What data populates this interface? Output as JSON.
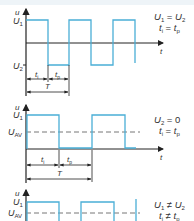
{
  "header": {
    "cut_text": ""
  },
  "colors": {
    "signal": "#4aaed6",
    "axis": "#222222",
    "dashed": "#666666",
    "text": "#333333"
  },
  "graphs": [
    {
      "id": "graph1",
      "y_axis_label": "u",
      "level_labels": {
        "high": "U",
        "high_sub": "1",
        "low": "U",
        "low_sub": "2"
      },
      "x_axis_label": "t",
      "condition_line1": {
        "a": "U",
        "a_sub": "1",
        "op": " = ",
        "b": "U",
        "b_sub": "2"
      },
      "condition_line2": {
        "a": "t",
        "a_sub": "i",
        "op": " = ",
        "b": "t",
        "b_sub": "p"
      },
      "dim_ti": {
        "t": "t",
        "sub": "i"
      },
      "dim_tp": {
        "t": "t",
        "sub": "p"
      },
      "dim_T": "T"
    },
    {
      "id": "graph2",
      "y_axis_label": "u",
      "level_labels": {
        "high": "U",
        "high_sub": "1",
        "avg": "U",
        "avg_sub": "AV"
      },
      "x_axis_label": "t",
      "condition_line1": {
        "a": "U",
        "a_sub": "2",
        "op": " = ",
        "b": "0",
        "b_sub": ""
      },
      "condition_line2": {
        "a": "t",
        "a_sub": "i",
        "op": " = ",
        "b": "t",
        "b_sub": "p"
      },
      "dim_ti": {
        "t": "t",
        "sub": "i"
      },
      "dim_tp": {
        "t": "t",
        "sub": "p"
      },
      "dim_T": "T"
    },
    {
      "id": "graph3",
      "y_axis_label": "u",
      "level_labels": {
        "high": "U",
        "high_sub": "1",
        "avg": "U",
        "avg_sub": "AV"
      },
      "condition_line1": {
        "a": "U",
        "a_sub": "1",
        "op": " ≠ ",
        "b": "U",
        "b_sub": "2"
      },
      "condition_line2": {
        "a": "t",
        "a_sub": "i",
        "op": " ≠ ",
        "b": "t",
        "b_sub": "p"
      }
    }
  ]
}
